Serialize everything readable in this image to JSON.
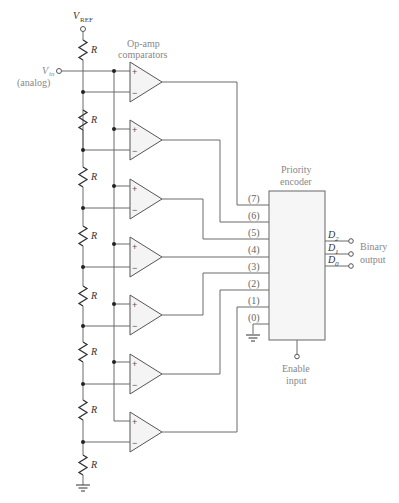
{
  "diagram": {
    "vref_label": "V",
    "vref_sub": "REF",
    "vin_label": "V",
    "vin_sub": "in",
    "vin_note": "(analog)",
    "resistor_label": "R",
    "comparators_label_line1": "Op-amp",
    "comparators_label_line2": "comparators",
    "plus_sign": "+",
    "minus_sign": "−",
    "encoder_label_line1": "Priority",
    "encoder_label_line2": "encoder",
    "encoder_inputs": [
      "(7)",
      "(6)",
      "(5)",
      "(4)",
      "(3)",
      "(2)",
      "(1)",
      "(0)"
    ],
    "outputs": [
      {
        "name": "D",
        "sub": "2"
      },
      {
        "name": "D",
        "sub": "1"
      },
      {
        "name": "D",
        "sub": "0"
      }
    ],
    "output_label_line1": "Binary",
    "output_label_line2": "output",
    "enable_label_line1": "Enable",
    "enable_label_line2": "input",
    "resistor_count": 8,
    "comparator_count": 7
  }
}
